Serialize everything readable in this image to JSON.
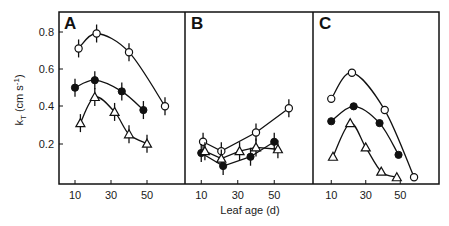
{
  "chart_data": [
    {
      "panel": "A",
      "type": "line",
      "xlabel": "Leaf age (d)",
      "ylabel": "kT (cm s-1)",
      "xticks": [
        10,
        30,
        50
      ],
      "yticks": [
        0.2,
        0.4,
        0.6,
        0.8
      ],
      "xlim": [
        0,
        70
      ],
      "ylim": [
        0,
        0.9
      ],
      "error_bars": true,
      "series": [
        {
          "name": "open-circle",
          "marker": "open-circle",
          "x": [
            12,
            22,
            40,
            60
          ],
          "y": [
            0.71,
            0.79,
            0.69,
            0.4
          ]
        },
        {
          "name": "filled-circle",
          "marker": "filled-circle",
          "x": [
            10,
            21,
            36,
            48
          ],
          "y": [
            0.5,
            0.54,
            0.48,
            0.38
          ]
        },
        {
          "name": "open-triangle",
          "marker": "open-triangle",
          "x": [
            13,
            21,
            32,
            40,
            50
          ],
          "y": [
            0.31,
            0.45,
            0.37,
            0.25,
            0.2
          ]
        }
      ]
    },
    {
      "panel": "B",
      "type": "line",
      "xlabel": "Leaf age (d)",
      "xticks": [
        10,
        30,
        50
      ],
      "xlim": [
        0,
        70
      ],
      "ylim": [
        0,
        0.9
      ],
      "error_bars": true,
      "series": [
        {
          "name": "open-circle",
          "marker": "open-circle",
          "x": [
            11,
            21,
            40,
            58
          ],
          "y": [
            0.21,
            0.16,
            0.26,
            0.39
          ]
        },
        {
          "name": "filled-circle",
          "marker": "filled-circle",
          "x": [
            10,
            22,
            37,
            50
          ],
          "y": [
            0.15,
            0.08,
            0.13,
            0.21
          ]
        },
        {
          "name": "open-triangle",
          "marker": "open-triangle",
          "x": [
            12,
            21,
            31,
            40,
            52
          ],
          "y": [
            0.16,
            0.12,
            0.16,
            0.18,
            0.17
          ]
        }
      ]
    },
    {
      "panel": "C",
      "type": "line",
      "xlabel": "Leaf age (d)",
      "xticks": [
        10,
        30,
        50
      ],
      "xlim": [
        0,
        70
      ],
      "ylim": [
        0,
        0.9
      ],
      "error_bars": false,
      "series": [
        {
          "name": "open-circle",
          "marker": "open-circle",
          "x": [
            10,
            22,
            41,
            58
          ],
          "y": [
            0.44,
            0.58,
            0.38,
            0.02
          ]
        },
        {
          "name": "filled-circle",
          "marker": "filled-circle",
          "x": [
            10,
            23,
            38,
            49
          ],
          "y": [
            0.32,
            0.4,
            0.31,
            0.14
          ]
        },
        {
          "name": "open-triangle",
          "marker": "open-triangle",
          "x": [
            11,
            21,
            30,
            39,
            48
          ],
          "y": [
            0.13,
            0.31,
            0.18,
            0.05,
            0.02
          ]
        }
      ]
    }
  ],
  "labels": {
    "panel_a": "A",
    "panel_b": "B",
    "panel_c": "C",
    "y_axis_title": "k",
    "y_axis_subscript": "T",
    "y_axis_units": " (cm s",
    "y_axis_exp": "-1",
    "y_axis_close": ")",
    "x_axis_title": "Leaf age (d)",
    "yticks": [
      "0.8",
      "0.6",
      "0.4",
      "0.2"
    ],
    "xticks": [
      "10",
      "30",
      "50"
    ]
  }
}
